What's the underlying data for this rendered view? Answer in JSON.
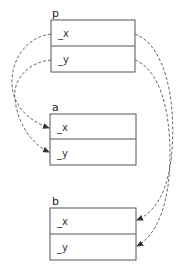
{
  "diagram": {
    "type": "object-reference-diagram",
    "objects": [
      {
        "id": "p",
        "label": "p",
        "fields": [
          "_x",
          "_y"
        ]
      },
      {
        "id": "a",
        "label": "a",
        "fields": [
          "_x",
          "_y"
        ]
      },
      {
        "id": "b",
        "label": "b",
        "fields": [
          "_x",
          "_y"
        ]
      }
    ],
    "edges": [
      {
        "from": "p._x",
        "to": "a._x",
        "style": "dashed-arrow"
      },
      {
        "from": "p._y",
        "to": "a._y",
        "style": "dashed-arrow"
      },
      {
        "from": "p._x",
        "to": "b._x",
        "style": "dashed-arrow"
      },
      {
        "from": "p._y",
        "to": "b._y",
        "style": "dashed-arrow"
      }
    ],
    "colors": {
      "stroke": "#555555",
      "text": "#222222",
      "background": "#ffffff"
    }
  }
}
